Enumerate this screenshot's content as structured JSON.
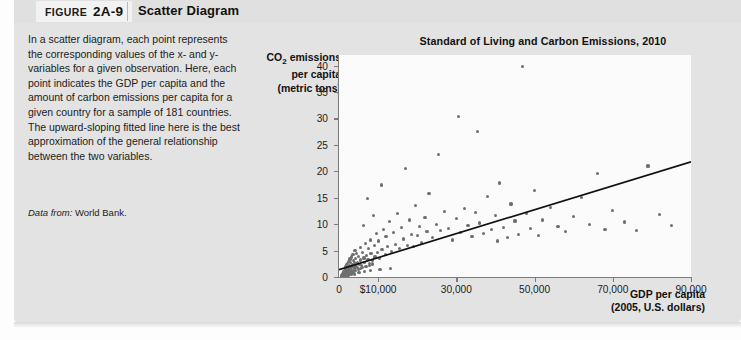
{
  "figure": {
    "label_word": "FIGURE",
    "number": "2A-9",
    "title": "Scatter Diagram"
  },
  "caption": {
    "body": "In a scatter diagram, each point represents the corresponding values of the x- and y-variables for a given observation. Here, each point indicates the GDP per capita and the amount of carbon emissions per capita for a given country for a sample of 181 countries. The upward-sloping fitted line here is the best approximation of the general relationship between the two variables.",
    "source_lead": "Data from:",
    "source_text": " World Bank."
  },
  "colors": {
    "panel_background": "#e3e3e3",
    "header_background": "#e0e0e0",
    "tab_background": "#f2f2f2",
    "plot_background": "#fbfbfb",
    "axis": "#7a7a7a",
    "point": "#6f6f6f",
    "fit_line": "#101010",
    "text": "#1c1c1c"
  },
  "chart_data": {
    "type": "scatter",
    "title": "Standard of Living and Carbon Emissions, 2010",
    "xlabel_line1": "GDP per capita",
    "xlabel_line2": "(2005, U.S. dollars)",
    "ylabel_line1": "CO2 emissions",
    "ylabel_line2": "per capita",
    "ylabel_line3": "(metric tons)",
    "xlim": [
      0,
      90000
    ],
    "ylim": [
      0,
      42
    ],
    "grid": false,
    "legend": null,
    "n_observations": 181,
    "xticks": [
      0,
      10000,
      30000,
      50000,
      70000,
      90000
    ],
    "xtick_labels": [
      "0",
      "$10,000",
      "30,000",
      "50,000",
      "70,000",
      "90,000"
    ],
    "yticks": [
      0,
      5,
      10,
      15,
      20,
      25,
      30,
      35,
      40
    ],
    "ytick_labels": [
      "0",
      "5",
      "10",
      "15",
      "20",
      "25",
      "30",
      "35",
      "40"
    ],
    "fit_line": {
      "x": [
        0,
        90000
      ],
      "y": [
        1.4,
        21.8
      ],
      "description": "upward-sloping fitted line"
    },
    "points": [
      [
        600,
        0.3
      ],
      [
        700,
        0.2
      ],
      [
        800,
        0.5
      ],
      [
        900,
        0.3
      ],
      [
        1000,
        0.6
      ],
      [
        1050,
        0.4
      ],
      [
        1100,
        0.8
      ],
      [
        1200,
        0.3
      ],
      [
        1250,
        1.1
      ],
      [
        1300,
        0.5
      ],
      [
        1350,
        0.9
      ],
      [
        1400,
        0.4
      ],
      [
        1450,
        1.3
      ],
      [
        1500,
        0.7
      ],
      [
        1550,
        0.5
      ],
      [
        1600,
        1.6
      ],
      [
        1650,
        0.9
      ],
      [
        1700,
        0.4
      ],
      [
        1750,
        1.2
      ],
      [
        1800,
        2.0
      ],
      [
        1850,
        0.7
      ],
      [
        1900,
        1.5
      ],
      [
        1950,
        0.6
      ],
      [
        2000,
        2.3
      ],
      [
        2050,
        1.0
      ],
      [
        2100,
        1.8
      ],
      [
        2200,
        0.8
      ],
      [
        2250,
        2.6
      ],
      [
        2300,
        1.3
      ],
      [
        2400,
        0.9
      ],
      [
        2450,
        3.0
      ],
      [
        2500,
        1.7
      ],
      [
        2600,
        1.1
      ],
      [
        2700,
        2.2
      ],
      [
        2750,
        0.7
      ],
      [
        2800,
        3.4
      ],
      [
        2900,
        1.4
      ],
      [
        3000,
        2.7
      ],
      [
        3100,
        1.0
      ],
      [
        3200,
        3.8
      ],
      [
        3300,
        1.9
      ],
      [
        3400,
        2.4
      ],
      [
        3500,
        1.3
      ],
      [
        3600,
        4.2
      ],
      [
        3700,
        2.0
      ],
      [
        3800,
        3.1
      ],
      [
        3900,
        1.6
      ],
      [
        4000,
        2.8
      ],
      [
        4100,
        5.0
      ],
      [
        4200,
        1.9
      ],
      [
        4300,
        3.5
      ],
      [
        4400,
        2.3
      ],
      [
        4500,
        4.4
      ],
      [
        4700,
        2.7
      ],
      [
        4800,
        1.8
      ],
      [
        5000,
        3.9
      ],
      [
        5200,
        2.4
      ],
      [
        5400,
        5.6
      ],
      [
        5600,
        3.2
      ],
      [
        5800,
        2.1
      ],
      [
        6000,
        4.7
      ],
      [
        6200,
        9.8
      ],
      [
        6400,
        3.6
      ],
      [
        6600,
        2.8
      ],
      [
        6800,
        6.3
      ],
      [
        7000,
        4.1
      ],
      [
        7200,
        14.8
      ],
      [
        7400,
        3.3
      ],
      [
        7600,
        5.4
      ],
      [
        7800,
        2.6
      ],
      [
        8000,
        7.0
      ],
      [
        8200,
        4.5
      ],
      [
        8500,
        3.1
      ],
      [
        8800,
        11.6
      ],
      [
        9000,
        5.9
      ],
      [
        9200,
        3.8
      ],
      [
        9500,
        8.2
      ],
      [
        9800,
        4.6
      ],
      [
        10000,
        6.8
      ],
      [
        10400,
        3.5
      ],
      [
        10800,
        17.4
      ],
      [
        11000,
        5.2
      ],
      [
        11400,
        9.0
      ],
      [
        11800,
        4.2
      ],
      [
        12000,
        7.6
      ],
      [
        12500,
        5.8
      ],
      [
        13000,
        10.5
      ],
      [
        13500,
        4.8
      ],
      [
        14000,
        8.4
      ],
      [
        14500,
        6.2
      ],
      [
        15000,
        12.0
      ],
      [
        15500,
        5.4
      ],
      [
        16000,
        9.4
      ],
      [
        16500,
        7.2
      ],
      [
        17000,
        20.6
      ],
      [
        17500,
        6.0
      ],
      [
        18000,
        10.8
      ],
      [
        18500,
        8.0
      ],
      [
        19000,
        5.7
      ],
      [
        19500,
        13.5
      ],
      [
        20000,
        7.8
      ],
      [
        20500,
        9.6
      ],
      [
        21000,
        6.5
      ],
      [
        22000,
        11.2
      ],
      [
        22500,
        8.6
      ],
      [
        23000,
        15.8
      ],
      [
        24000,
        7.4
      ],
      [
        25000,
        10.0
      ],
      [
        25500,
        23.2
      ],
      [
        26000,
        8.8
      ],
      [
        27000,
        12.4
      ],
      [
        28000,
        9.2
      ],
      [
        29000,
        7.0
      ],
      [
        30000,
        11.0
      ],
      [
        30500,
        30.4
      ],
      [
        31000,
        8.4
      ],
      [
        32000,
        13.0
      ],
      [
        33000,
        9.8
      ],
      [
        34000,
        7.6
      ],
      [
        35000,
        12.2
      ],
      [
        35500,
        27.6
      ],
      [
        36000,
        10.2
      ],
      [
        37000,
        8.2
      ],
      [
        38000,
        15.2
      ],
      [
        39000,
        9.0
      ],
      [
        40000,
        11.6
      ],
      [
        40500,
        6.8
      ],
      [
        41000,
        17.8
      ],
      [
        42000,
        9.4
      ],
      [
        43000,
        7.4
      ],
      [
        44000,
        13.8
      ],
      [
        45000,
        10.6
      ],
      [
        46000,
        8.0
      ],
      [
        47000,
        39.8
      ],
      [
        48000,
        12.0
      ],
      [
        49000,
        9.2
      ],
      [
        50000,
        16.4
      ],
      [
        51000,
        7.8
      ],
      [
        52000,
        10.8
      ],
      [
        54000,
        13.2
      ],
      [
        56000,
        9.6
      ],
      [
        58000,
        8.6
      ],
      [
        60000,
        11.4
      ],
      [
        62000,
        15.0
      ],
      [
        64000,
        10.0
      ],
      [
        66000,
        19.6
      ],
      [
        68000,
        9.0
      ],
      [
        70000,
        12.6
      ],
      [
        73000,
        10.4
      ],
      [
        76000,
        8.8
      ],
      [
        79000,
        21.0
      ],
      [
        82000,
        11.8
      ],
      [
        85000,
        9.8
      ],
      [
        1500,
        0.2
      ],
      [
        1700,
        0.15
      ],
      [
        2100,
        0.35
      ],
      [
        2300,
        0.55
      ],
      [
        2600,
        0.45
      ],
      [
        3000,
        0.65
      ],
      [
        3400,
        0.85
      ],
      [
        3800,
        1.05
      ],
      [
        4300,
        1.25
      ],
      [
        4900,
        1.45
      ],
      [
        5500,
        1.65
      ],
      [
        6100,
        1.85
      ],
      [
        6900,
        2.05
      ],
      [
        7700,
        2.25
      ],
      [
        8600,
        2.45
      ],
      [
        900,
        0.12
      ],
      [
        1150,
        0.22
      ],
      [
        1400,
        0.18
      ],
      [
        1900,
        0.28
      ],
      [
        2450,
        0.38
      ],
      [
        3150,
        0.48
      ],
      [
        4050,
        0.58
      ],
      [
        5100,
        0.78
      ],
      [
        6500,
        0.98
      ],
      [
        8100,
        1.18
      ],
      [
        10500,
        1.38
      ],
      [
        13200,
        1.58
      ]
    ]
  }
}
